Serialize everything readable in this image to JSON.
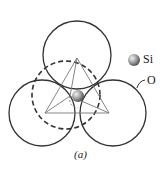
{
  "diagram": {
    "legend": [
      {
        "label": "Si",
        "icon": "silicon-atom-sphere"
      },
      {
        "label": "O",
        "icon": "oxygen-atom-circle"
      }
    ],
    "caption": "(a)"
  }
}
